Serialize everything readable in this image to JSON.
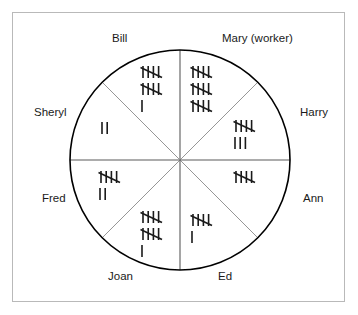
{
  "figure": {
    "type": "tally-pie-chart",
    "frame": {
      "border_color": "#b9b9b9"
    },
    "circle": {
      "center_x": 180,
      "center_y": 160,
      "radius": 110,
      "stroke_color": "#000000",
      "divider_color": "#8a8a8a"
    },
    "tally_stroke_color": "#1a1a1a"
  },
  "chart_data": {
    "type": "pie",
    "title": "",
    "subtitle": "",
    "xlabel": "",
    "ylabel": "",
    "legend_position": "around-circle",
    "grid": false,
    "notation": "tally-marks",
    "categories": [
      "Bill",
      "Mary (worker)",
      "Harry",
      "Ann",
      "Ed",
      "Joan",
      "Fred",
      "Sheryl"
    ],
    "values": [
      11,
      15,
      8,
      5,
      6,
      11,
      7,
      2
    ],
    "sectors": [
      {
        "label": "Bill",
        "label_x": 112,
        "label_y": 32,
        "start_angle": 270,
        "end_angle": 315,
        "tally_total": 11,
        "tally_text": "|||| |||| |",
        "tally_x": 140,
        "tally_y": 64,
        "tally_rows": [
          {
            "groups": 1,
            "singles": 0
          },
          {
            "groups": 1,
            "singles": 0
          },
          {
            "groups": 0,
            "singles": 1
          }
        ]
      },
      {
        "label": "Mary (worker)",
        "label_x": 222,
        "label_y": 32,
        "start_angle": 315,
        "end_angle": 0,
        "tally_total": 15,
        "tally_text": "|||| |||| ||||",
        "tally_x": 190,
        "tally_y": 64,
        "tally_rows": [
          {
            "groups": 1,
            "singles": 0
          },
          {
            "groups": 1,
            "singles": 0
          },
          {
            "groups": 1,
            "singles": 0
          }
        ]
      },
      {
        "label": "Harry",
        "label_x": 300,
        "label_y": 106,
        "start_angle": 0,
        "end_angle": 45,
        "tally_total": 8,
        "tally_text": "|||| |||",
        "tally_x": 233,
        "tally_y": 118,
        "tally_rows": [
          {
            "groups": 1,
            "singles": 0
          },
          {
            "groups": 0,
            "singles": 3
          }
        ]
      },
      {
        "label": "Ann",
        "label_x": 303,
        "label_y": 192,
        "start_angle": 45,
        "end_angle": 90,
        "tally_total": 5,
        "tally_text": "||||",
        "tally_x": 233,
        "tally_y": 169,
        "tally_rows": [
          {
            "groups": 1,
            "singles": 0
          }
        ]
      },
      {
        "label": "Ed",
        "label_x": 218,
        "label_y": 270,
        "start_angle": 90,
        "end_angle": 135,
        "tally_total": 6,
        "tally_text": "|||| |",
        "tally_x": 190,
        "tally_y": 212,
        "tally_rows": [
          {
            "groups": 1,
            "singles": 0
          },
          {
            "groups": 0,
            "singles": 1
          }
        ]
      },
      {
        "label": "Joan",
        "label_x": 108,
        "label_y": 270,
        "start_angle": 135,
        "end_angle": 180,
        "tally_total": 11,
        "tally_text": "|||| |||| |",
        "tally_x": 140,
        "tally_y": 209,
        "tally_rows": [
          {
            "groups": 1,
            "singles": 0
          },
          {
            "groups": 1,
            "singles": 0
          },
          {
            "groups": 0,
            "singles": 1
          }
        ]
      },
      {
        "label": "Fred",
        "label_x": 42,
        "label_y": 192,
        "start_angle": 180,
        "end_angle": 225,
        "tally_total": 7,
        "tally_text": "|||| ||",
        "tally_x": 98,
        "tally_y": 169,
        "tally_rows": [
          {
            "groups": 1,
            "singles": 0
          },
          {
            "groups": 0,
            "singles": 2
          }
        ]
      },
      {
        "label": "Sheryl",
        "label_x": 34,
        "label_y": 106,
        "start_angle": 225,
        "end_angle": 270,
        "tally_total": 2,
        "tally_text": "||",
        "tally_x": 100,
        "tally_y": 120,
        "tally_rows": [
          {
            "groups": 0,
            "singles": 2
          }
        ]
      }
    ]
  }
}
